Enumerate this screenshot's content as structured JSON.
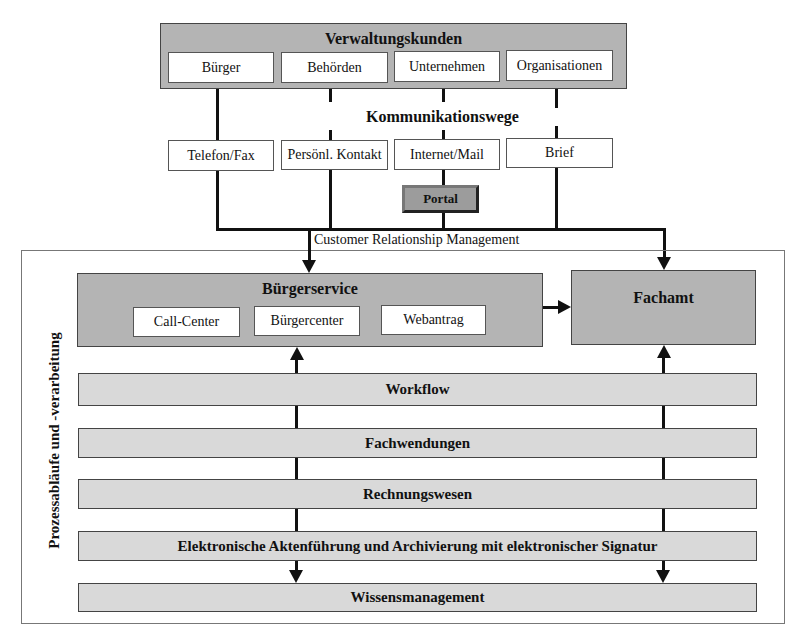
{
  "customers": {
    "title": "Verwaltungskunden",
    "items": [
      "Bürger",
      "Behörden",
      "Unternehmen",
      "Organisationen"
    ]
  },
  "channels": {
    "title": "Kommunikationswege",
    "items": [
      "Telefon/Fax",
      "Persönl. Kontakt",
      "Internet/Mail",
      "Brief"
    ],
    "portal": "Portal"
  },
  "crm_label": "Customer Relationship Management",
  "process": {
    "side_label": "Prozessabläufe und -verarbeitung",
    "buergerservice": {
      "title": "Bürgerservice",
      "items": [
        "Call-Center",
        "Bürgercenter",
        "Webantrag"
      ]
    },
    "fachamt": {
      "title": "Fachamt"
    },
    "layers": [
      "Workflow",
      "Fachwendungen",
      "Rechnungswesen",
      "Elektronische Aktenführung und Archivierung mit elektronischer Signatur",
      "Wissensmanagement"
    ]
  },
  "colors": {
    "dark_box": "#b4b4b4",
    "light_bar": "#d9d9d9",
    "portal": "#9c9c9c",
    "line": "#111111"
  }
}
